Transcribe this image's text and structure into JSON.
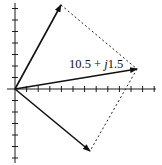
{
  "diagram": {
    "type": "phasor-diagram",
    "origin": [
      15,
      89
    ],
    "axes": {
      "x": {
        "from": 7,
        "to": 156,
        "tick_spacing": 11.6,
        "tick_count": 12
      },
      "y": {
        "from": 3,
        "to": 163,
        "tick_spacing": 11.5,
        "ticks_above": 7,
        "ticks_below": 6
      }
    },
    "phasors": [
      {
        "name": "upper-phasor",
        "tip": [
          61,
          5
        ]
      },
      {
        "name": "resultant-phasor",
        "tip": [
          137,
          69
        ],
        "label": {
          "real": "10.5",
          "op": " + ",
          "imag_unit": "j",
          "imag": "1.5"
        }
      },
      {
        "name": "lower-phasor",
        "tip": [
          90,
          151
        ]
      }
    ],
    "construction_lines": [
      {
        "from": [
          61,
          5
        ],
        "to": [
          137,
          69
        ]
      },
      {
        "from": [
          137,
          69
        ],
        "to": [
          90,
          151
        ]
      }
    ],
    "colors": {
      "ink": "#111111",
      "background": "#ffffff"
    }
  }
}
